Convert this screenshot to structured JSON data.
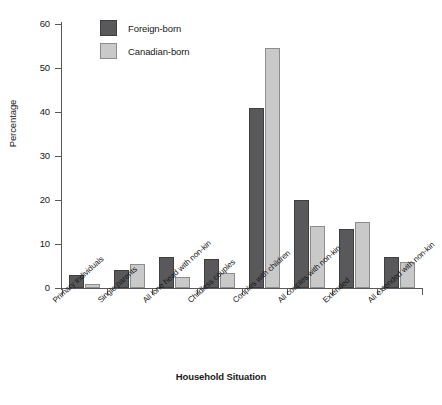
{
  "chart_data": {
    "type": "bar",
    "title": "",
    "xlabel": "Household Situation",
    "ylabel": "Percentage",
    "ylim": [
      0,
      60
    ],
    "yticks": [
      0,
      10,
      20,
      30,
      40,
      50,
      60
    ],
    "ytick_labels": [
      "0",
      "10",
      "20",
      "30",
      "40",
      "50",
      "60"
    ],
    "grid": false,
    "legend_position": "top-left-inside",
    "categories": [
      "Primary individuals",
      "Single parents",
      "All lone head with non-kin",
      "Childless couples",
      "Couples with children",
      "All couples with non-kin",
      "Extended",
      "All extended with non-kin"
    ],
    "series": [
      {
        "name": "Foreign-born",
        "color": "#59595b",
        "values": [
          3.0,
          4.0,
          7.0,
          6.5,
          41.0,
          20.0,
          13.5,
          7.0
        ]
      },
      {
        "name": "Canadian-born",
        "color": "#c9c9c9",
        "values": [
          1.0,
          5.5,
          2.5,
          3.5,
          54.5,
          14.0,
          15.0,
          6.0
        ]
      }
    ]
  },
  "legend": {
    "items": [
      {
        "label": "Foreign-born",
        "swatch": "dark-gray-swatch"
      },
      {
        "label": "Canadian-born",
        "swatch": "light-gray-swatch"
      }
    ]
  }
}
